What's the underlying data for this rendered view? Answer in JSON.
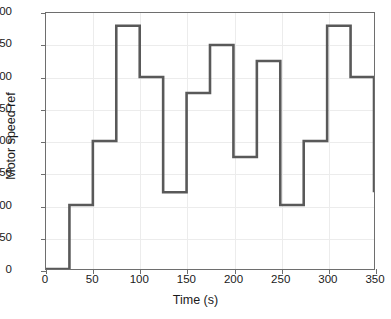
{
  "chart_data": {
    "type": "line",
    "subtype": "staircase",
    "title": "",
    "xlabel": "Time (s)",
    "ylabel": "Motor speed ref",
    "xlim": [
      0,
      350
    ],
    "ylim": [
      0,
      400
    ],
    "xticks": [
      0,
      50,
      100,
      150,
      200,
      250,
      300,
      350
    ],
    "yticks": [
      0,
      50,
      100,
      150,
      200,
      250,
      300,
      350,
      400
    ],
    "grid": true,
    "legend": null,
    "series": [
      {
        "name": "Motor speed ref",
        "color": "#595959",
        "line_width": 2.6,
        "step_edges": [
          0,
          25,
          50,
          75,
          100,
          125,
          150,
          175,
          200,
          225,
          250,
          275,
          300,
          325,
          350
        ],
        "step_values": [
          0,
          100,
          200,
          380,
          300,
          120,
          275,
          350,
          175,
          325,
          100,
          200,
          380,
          300
        ],
        "final_drop_value": 120,
        "x": [
          0,
          25,
          25,
          50,
          50,
          75,
          75,
          100,
          100,
          125,
          125,
          150,
          150,
          175,
          175,
          200,
          200,
          225,
          225,
          250,
          250,
          275,
          275,
          300,
          300,
          325,
          325,
          350,
          350
        ],
        "y": [
          0,
          0,
          100,
          100,
          200,
          200,
          380,
          380,
          300,
          300,
          120,
          120,
          275,
          275,
          350,
          350,
          175,
          175,
          325,
          325,
          100,
          100,
          200,
          200,
          380,
          380,
          300,
          300,
          120
        ]
      }
    ]
  },
  "axes": {
    "x_tick_labels": [
      "0",
      "50",
      "100",
      "150",
      "200",
      "250",
      "300",
      "350"
    ],
    "y_tick_labels": [
      "0",
      "50",
      "100",
      "150",
      "200",
      "250",
      "300",
      "350",
      "400"
    ]
  },
  "style": {
    "series_color": "#595959",
    "grid_color": "#ececec",
    "axis_color": "#6e6e6e",
    "text_color": "#1a1a1a",
    "background": "#ffffff"
  }
}
